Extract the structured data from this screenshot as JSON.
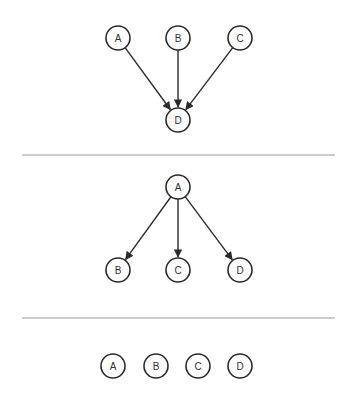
{
  "colors": {
    "background": "#ffffff",
    "node_stroke": "#2b2b2b",
    "edge": "#2b2b2b",
    "separator": "#9a9a9a",
    "label": "#333333"
  },
  "node_radius": 12,
  "diagrams": [
    {
      "name": "converging",
      "nodes": [
        {
          "id": "A",
          "label": "A",
          "x": 118,
          "y": 38
        },
        {
          "id": "B",
          "label": "B",
          "x": 178,
          "y": 38
        },
        {
          "id": "C",
          "label": "C",
          "x": 240,
          "y": 38
        },
        {
          "id": "D",
          "label": "D",
          "x": 178,
          "y": 120
        }
      ],
      "edges": [
        {
          "from": "A",
          "to": "D"
        },
        {
          "from": "B",
          "to": "D"
        },
        {
          "from": "C",
          "to": "D"
        }
      ]
    },
    {
      "name": "diverging",
      "nodes": [
        {
          "id": "A",
          "label": "A",
          "x": 178,
          "y": 187
        },
        {
          "id": "B",
          "label": "B",
          "x": 118,
          "y": 270
        },
        {
          "id": "C",
          "label": "C",
          "x": 178,
          "y": 270
        },
        {
          "id": "D",
          "label": "D",
          "x": 240,
          "y": 270
        }
      ],
      "edges": [
        {
          "from": "A",
          "to": "B"
        },
        {
          "from": "A",
          "to": "C"
        },
        {
          "from": "A",
          "to": "D"
        }
      ]
    },
    {
      "name": "independent",
      "nodes": [
        {
          "id": "A",
          "label": "A",
          "x": 113,
          "y": 366
        },
        {
          "id": "B",
          "label": "B",
          "x": 156,
          "y": 366
        },
        {
          "id": "C",
          "label": "C",
          "x": 198,
          "y": 366
        },
        {
          "id": "D",
          "label": "D",
          "x": 240,
          "y": 366
        }
      ],
      "edges": []
    }
  ],
  "separators": [
    {
      "x1": 22,
      "x2": 335,
      "y": 155
    },
    {
      "x1": 22,
      "x2": 335,
      "y": 318
    }
  ]
}
